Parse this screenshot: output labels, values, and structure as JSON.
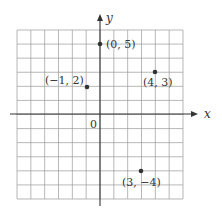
{
  "figure": {
    "x_axis_label": "x",
    "y_axis_label": "y",
    "origin_label": "0"
  },
  "chart_data": {
    "type": "scatter",
    "title": "",
    "xlabel": "x",
    "ylabel": "y",
    "xlim": [
      -6,
      6
    ],
    "ylim": [
      -6,
      6
    ],
    "grid": true,
    "points": [
      {
        "x": 0,
        "y": 5,
        "label": "(0, 5)"
      },
      {
        "x": 4,
        "y": 3,
        "label": "(4, 3)"
      },
      {
        "x": -1,
        "y": 2,
        "label": "(−1, 2)"
      },
      {
        "x": 3,
        "y": -4,
        "label": "(3, −4)"
      }
    ]
  },
  "colors": {
    "grid": "#9a9a9a",
    "axis": "#333333",
    "point": "#333333",
    "background": "#ffffff"
  }
}
